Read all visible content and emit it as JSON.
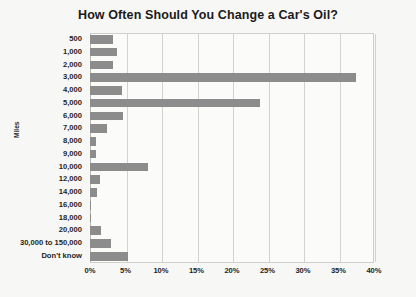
{
  "chart_data": {
    "type": "bar",
    "orientation": "horizontal",
    "title": "How Often Should You Change a Car's Oil?",
    "xlabel": "",
    "ylabel": "Miles",
    "xlim": [
      0,
      40
    ],
    "xunit": "%",
    "grid": true,
    "legend": "none",
    "bar_color": "#8c8c8c",
    "background_color": "#f7f7f5",
    "xticks": [
      "0%",
      "5%",
      "10%",
      "15%",
      "20%",
      "25%",
      "30%",
      "35%",
      "40%"
    ],
    "xtick_values": [
      0,
      5,
      10,
      15,
      20,
      25,
      30,
      35,
      40
    ],
    "categories": [
      "500",
      "1,000",
      "2,000",
      "3,000",
      "4,000",
      "5,000",
      "6,000",
      "7,000",
      "8,000",
      "9,000",
      "10,000",
      "12,000",
      "14,000",
      "16,000",
      "18,000",
      "20,000",
      "30,000 to 150,000",
      "Don't know"
    ],
    "values": [
      3.2,
      3.8,
      3.2,
      37.5,
      4.5,
      24.0,
      4.7,
      2.4,
      0.8,
      0.9,
      8.2,
      1.4,
      1.0,
      0.2,
      0.2,
      1.5,
      3.0,
      5.4
    ]
  }
}
